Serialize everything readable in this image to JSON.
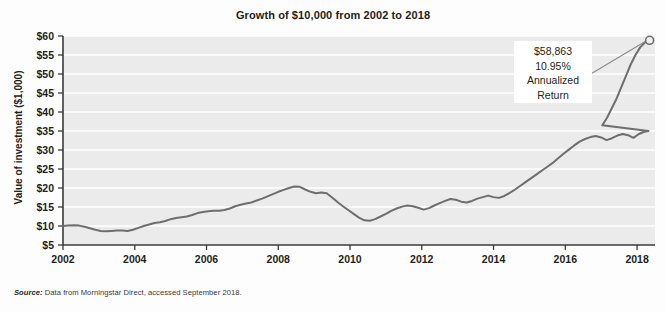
{
  "chart_data": {
    "type": "line",
    "title": "Growth of $10,000 from 2002 to 2018",
    "xlabel": "Year",
    "ylabel": "Value of investment ($1,000)",
    "xlim": [
      2002,
      2018.5
    ],
    "ylim": [
      5,
      60
    ],
    "grid": true,
    "legend": "none",
    "xticks": [
      "2002",
      "2004",
      "2006",
      "2008",
      "2010",
      "2012",
      "2014",
      "2016",
      "2018"
    ],
    "xtick_values": [
      2002,
      2004,
      2006,
      2008,
      2010,
      2012,
      2014,
      2016,
      2018
    ],
    "yticks": [
      "$5",
      "$10",
      "$15",
      "$20",
      "$25",
      "$30",
      "$35",
      "$40",
      "$45",
      "$50",
      "$55",
      "$60"
    ],
    "ytick_values": [
      5,
      10,
      15,
      20,
      25,
      30,
      35,
      40,
      45,
      50,
      55,
      60
    ],
    "series": [
      {
        "name": "Value of investment",
        "color": "#6e6e6e",
        "x": [
          2002.0,
          2002.15,
          2002.3,
          2002.45,
          2002.6,
          2002.75,
          2002.9,
          2003.05,
          2003.2,
          2003.35,
          2003.5,
          2003.65,
          2003.8,
          2003.95,
          2004.1,
          2004.25,
          2004.4,
          2004.55,
          2004.7,
          2004.85,
          2005.0,
          2005.15,
          2005.3,
          2005.45,
          2005.6,
          2005.75,
          2005.9,
          2006.05,
          2006.2,
          2006.35,
          2006.5,
          2006.65,
          2006.8,
          2006.95,
          2007.1,
          2007.25,
          2007.4,
          2007.55,
          2007.7,
          2007.85,
          2008.0,
          2008.15,
          2008.3,
          2008.45,
          2008.6,
          2008.75,
          2008.9,
          2009.05,
          2009.2,
          2009.35,
          2009.5,
          2009.65,
          2009.8,
          2009.95,
          2010.1,
          2010.25,
          2010.4,
          2010.55,
          2010.7,
          2010.85,
          2011.0,
          2011.15,
          2011.3,
          2011.45,
          2011.6,
          2011.75,
          2011.9,
          2012.05,
          2012.2,
          2012.35,
          2012.5,
          2012.65,
          2012.8,
          2012.95,
          2013.1,
          2013.25,
          2013.4,
          2013.55,
          2013.7,
          2013.85,
          2014.0,
          2014.15,
          2014.3,
          2014.45,
          2014.6,
          2014.75,
          2014.9,
          2015.05,
          2015.2,
          2015.35,
          2015.5,
          2015.65,
          2015.8,
          2015.95,
          2016.1,
          2016.25,
          2016.4,
          2016.55,
          2016.7,
          2016.85,
          2017.0,
          2017.15,
          2017.3,
          2017.45,
          2017.6,
          2017.75,
          2017.9,
          2018.05,
          2018.2,
          2018.32
        ],
        "y": [
          10.0,
          10.1,
          10.2,
          10.1,
          9.8,
          9.4,
          9.0,
          8.7,
          8.6,
          8.7,
          8.8,
          8.8,
          8.7,
          9.0,
          9.5,
          10.0,
          10.4,
          10.8,
          11.0,
          11.3,
          11.8,
          12.1,
          12.3,
          12.5,
          12.9,
          13.4,
          13.7,
          13.9,
          14.0,
          14.0,
          14.2,
          14.6,
          15.2,
          15.6,
          15.9,
          16.2,
          16.7,
          17.2,
          17.8,
          18.4,
          19.0,
          19.5,
          20.0,
          20.4,
          20.3,
          19.6,
          19.0,
          18.6,
          18.8,
          18.6,
          17.5,
          16.3,
          15.2,
          14.2,
          13.2,
          12.2,
          11.5,
          11.4,
          11.8,
          12.5,
          13.2,
          14.0,
          14.6,
          15.1,
          15.4,
          15.2,
          14.8,
          14.3,
          14.7,
          15.4,
          16.0,
          16.6,
          17.1,
          16.9,
          16.4,
          16.2,
          16.6,
          17.2,
          17.6,
          18.0,
          17.6,
          17.4,
          17.9,
          18.7,
          19.6,
          20.6,
          21.6,
          22.6,
          23.6,
          24.6,
          25.6,
          26.6,
          27.8,
          29.0,
          30.1,
          31.2,
          32.2,
          32.9,
          33.4,
          33.7,
          33.3,
          32.6,
          33.1,
          33.8,
          34.2,
          33.9,
          33.2,
          34.2,
          34.8,
          35.0
        ],
        "y_late": [
          35.0,
          36.5,
          38.5,
          41.0,
          43.5,
          46.5,
          49.5,
          52.5,
          55.0,
          57.0,
          58.3,
          58.863
        ]
      }
    ],
    "endpoint_marker": {
      "x": 2018.35,
      "y": 58.863,
      "shape": "circle-open",
      "color": "#6e6e6e"
    },
    "annotation": {
      "lines": [
        "$58,863",
        "10.95%",
        "Annualized",
        "Return"
      ],
      "value": 58863,
      "annualized_return_pct": 10.95
    }
  },
  "source": {
    "label": "Source:",
    "text": " Data from Morningstar Direct, accessed September 2018."
  },
  "style": {
    "plot_bg": "#ebebeb",
    "grid_color": "#ffffff",
    "axis_color": "#3b3b3b",
    "line_color": "#6e6e6e",
    "text_color": "#231f20"
  }
}
